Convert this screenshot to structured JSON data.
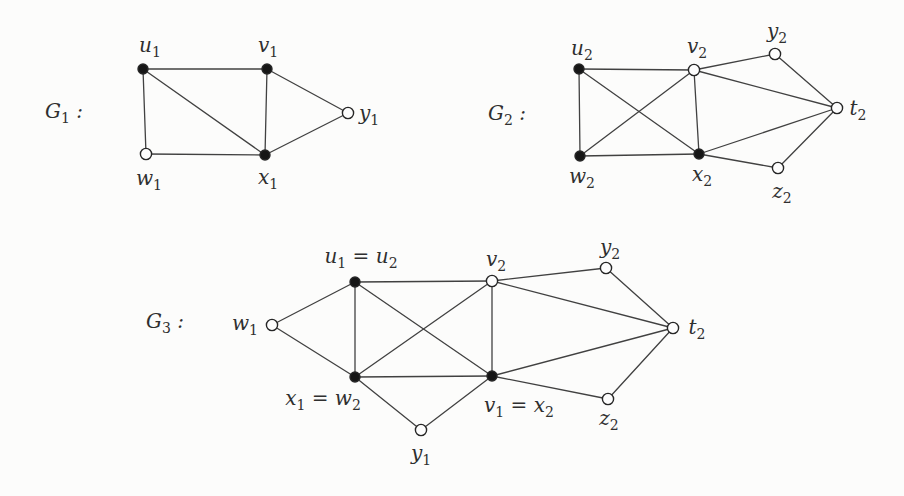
{
  "figure": {
    "width": 904,
    "height": 496,
    "background": "#fcfcfb",
    "edge_color": "#414141",
    "edge_width": 1.3,
    "vertex_stroke": "#262626",
    "vertex_stroke_width": 1.4,
    "vertex_filled_color": "#161616",
    "vertex_open_color": "#fdfdfd",
    "filled_radius": 5.0,
    "open_radius": 5.6,
    "font_size": 20,
    "sub_font_size": 14,
    "sub_dy": 5,
    "text_color": "#2f2f2f"
  },
  "graphs": [
    {
      "id": "G1",
      "label": {
        "parts": [
          {
            "t": "G",
            "sub": "1"
          },
          {
            "t": " :"
          }
        ],
        "x": 64,
        "y": 118
      },
      "vertices": [
        {
          "id": "u1",
          "x": 143,
          "y": 69,
          "filled": true,
          "label": {
            "parts": [
              {
                "t": "u",
                "sub": "1"
              }
            ],
            "x": 150,
            "y": 52
          }
        },
        {
          "id": "v1",
          "x": 267,
          "y": 69,
          "filled": true,
          "label": {
            "parts": [
              {
                "t": "v",
                "sub": "1"
              }
            ],
            "x": 268,
            "y": 52
          }
        },
        {
          "id": "y1",
          "x": 348,
          "y": 113,
          "filled": false,
          "label": {
            "parts": [
              {
                "t": "y",
                "sub": "1"
              }
            ],
            "x": 369,
            "y": 120
          }
        },
        {
          "id": "w1",
          "x": 146,
          "y": 154,
          "filled": false,
          "label": {
            "parts": [
              {
                "t": "w",
                "sub": "1"
              }
            ],
            "x": 149,
            "y": 185
          }
        },
        {
          "id": "x1",
          "x": 265,
          "y": 155,
          "filled": true,
          "label": {
            "parts": [
              {
                "t": "x",
                "sub": "1"
              }
            ],
            "x": 268,
            "y": 184
          }
        }
      ],
      "edges": [
        [
          "u1",
          "v1"
        ],
        [
          "u1",
          "w1"
        ],
        [
          "u1",
          "x1"
        ],
        [
          "v1",
          "x1"
        ],
        [
          "v1",
          "y1"
        ],
        [
          "x1",
          "y1"
        ],
        [
          "w1",
          "x1"
        ]
      ]
    },
    {
      "id": "G2",
      "label": {
        "parts": [
          {
            "t": "G",
            "sub": "2"
          },
          {
            "t": " :"
          }
        ],
        "x": 507,
        "y": 120
      },
      "vertices": [
        {
          "id": "u2",
          "x": 579,
          "y": 69,
          "filled": true,
          "label": {
            "parts": [
              {
                "t": "u",
                "sub": "2"
              }
            ],
            "x": 582,
            "y": 55
          }
        },
        {
          "id": "v2",
          "x": 694,
          "y": 70,
          "filled": false,
          "label": {
            "parts": [
              {
                "t": "v",
                "sub": "2"
              }
            ],
            "x": 697,
            "y": 53
          }
        },
        {
          "id": "y2",
          "x": 775,
          "y": 54,
          "filled": false,
          "label": {
            "parts": [
              {
                "t": "y",
                "sub": "2"
              }
            ],
            "x": 777,
            "y": 38
          }
        },
        {
          "id": "t2",
          "x": 837,
          "y": 108,
          "filled": false,
          "label": {
            "parts": [
              {
                "t": "t",
                "sub": "2"
              }
            ],
            "x": 858,
            "y": 115
          }
        },
        {
          "id": "w2",
          "x": 580,
          "y": 156,
          "filled": true,
          "label": {
            "parts": [
              {
                "t": "w",
                "sub": "2"
              }
            ],
            "x": 582,
            "y": 183
          }
        },
        {
          "id": "x2",
          "x": 699,
          "y": 154,
          "filled": true,
          "label": {
            "parts": [
              {
                "t": "x",
                "sub": "2"
              }
            ],
            "x": 702,
            "y": 181
          }
        },
        {
          "id": "z2",
          "x": 778,
          "y": 168,
          "filled": false,
          "label": {
            "parts": [
              {
                "t": "z",
                "sub": "2"
              }
            ],
            "x": 782,
            "y": 198
          }
        }
      ],
      "edges": [
        [
          "u2",
          "v2"
        ],
        [
          "u2",
          "w2"
        ],
        [
          "u2",
          "x2"
        ],
        [
          "v2",
          "w2"
        ],
        [
          "v2",
          "x2"
        ],
        [
          "v2",
          "y2"
        ],
        [
          "v2",
          "t2"
        ],
        [
          "w2",
          "x2"
        ],
        [
          "x2",
          "t2"
        ],
        [
          "x2",
          "z2"
        ],
        [
          "y2",
          "t2"
        ],
        [
          "z2",
          "t2"
        ]
      ]
    },
    {
      "id": "G3",
      "label": {
        "parts": [
          {
            "t": "G",
            "sub": "3"
          },
          {
            "t": " :"
          }
        ],
        "x": 165,
        "y": 328
      },
      "vertices": [
        {
          "id": "w1",
          "x": 272,
          "y": 325,
          "filled": false,
          "label": {
            "parts": [
              {
                "t": "w",
                "sub": "1"
              }
            ],
            "x": 245,
            "y": 330
          }
        },
        {
          "id": "u",
          "x": 355,
          "y": 282,
          "filled": true,
          "label": {
            "parts": [
              {
                "t": "u",
                "sub": "1"
              },
              {
                "t": " = "
              },
              {
                "t": "u",
                "sub": "2"
              }
            ],
            "x": 361,
            "y": 263
          }
        },
        {
          "id": "v2",
          "x": 492,
          "y": 281,
          "filled": false,
          "label": {
            "parts": [
              {
                "t": "v",
                "sub": "2"
              }
            ],
            "x": 496,
            "y": 266
          }
        },
        {
          "id": "y2",
          "x": 606,
          "y": 268,
          "filled": false,
          "label": {
            "parts": [
              {
                "t": "y",
                "sub": "2"
              }
            ],
            "x": 610,
            "y": 254
          }
        },
        {
          "id": "t2",
          "x": 673,
          "y": 328,
          "filled": false,
          "label": {
            "parts": [
              {
                "t": "t",
                "sub": "2"
              }
            ],
            "x": 697,
            "y": 334
          }
        },
        {
          "id": "xw",
          "x": 355,
          "y": 377,
          "filled": true,
          "label": {
            "parts": [
              {
                "t": "x",
                "sub": "1"
              },
              {
                "t": " = "
              },
              {
                "t": "w",
                "sub": "2"
              }
            ],
            "x": 323,
            "y": 405
          }
        },
        {
          "id": "vx",
          "x": 492,
          "y": 376,
          "filled": true,
          "label": {
            "parts": [
              {
                "t": "v",
                "sub": "1"
              },
              {
                "t": " = "
              },
              {
                "t": "x",
                "sub": "2"
              }
            ],
            "x": 519,
            "y": 412
          }
        },
        {
          "id": "y1",
          "x": 421,
          "y": 430,
          "filled": false,
          "label": {
            "parts": [
              {
                "t": "y",
                "sub": "1"
              }
            ],
            "x": 421,
            "y": 460
          }
        },
        {
          "id": "z2",
          "x": 608,
          "y": 399,
          "filled": false,
          "label": {
            "parts": [
              {
                "t": "z",
                "sub": "2"
              }
            ],
            "x": 609,
            "y": 425
          }
        }
      ],
      "edges": [
        [
          "w1",
          "u"
        ],
        [
          "w1",
          "xw"
        ],
        [
          "u",
          "v2"
        ],
        [
          "u",
          "xw"
        ],
        [
          "u",
          "vx"
        ],
        [
          "xw",
          "v2"
        ],
        [
          "xw",
          "vx"
        ],
        [
          "xw",
          "y1"
        ],
        [
          "vx",
          "y1"
        ],
        [
          "v2",
          "vx"
        ],
        [
          "v2",
          "y2"
        ],
        [
          "v2",
          "t2"
        ],
        [
          "vx",
          "t2"
        ],
        [
          "vx",
          "z2"
        ],
        [
          "y2",
          "t2"
        ],
        [
          "z2",
          "t2"
        ]
      ]
    }
  ]
}
